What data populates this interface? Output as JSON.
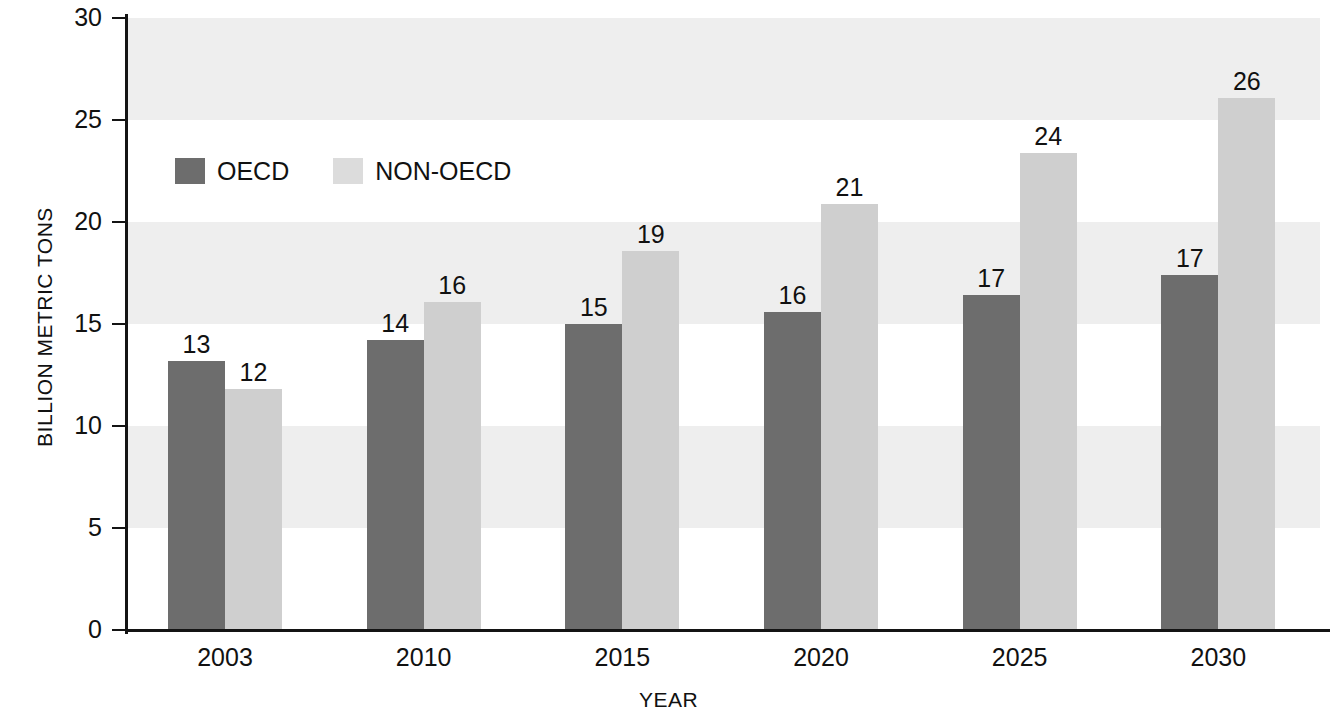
{
  "chart_data": {
    "type": "bar",
    "title": "",
    "xlabel": "YEAR",
    "ylabel": "BILLION METRIC TONS",
    "categories": [
      "2003",
      "2010",
      "2015",
      "2020",
      "2025",
      "2030"
    ],
    "series": [
      {
        "name": "OECD",
        "color": "#6d6d6d",
        "values": [
          13,
          14,
          15,
          16,
          17,
          17
        ],
        "plotted": [
          13.2,
          14.2,
          15.0,
          15.6,
          16.4,
          17.4
        ]
      },
      {
        "name": "NON-OECD",
        "color": "#cfcfcf",
        "values": [
          12,
          16,
          19,
          21,
          24,
          26
        ],
        "plotted": [
          11.8,
          16.1,
          18.6,
          20.9,
          23.4,
          26.1
        ]
      }
    ],
    "ylim": [
      0,
      30
    ],
    "yticks": [
      0,
      5,
      10,
      15,
      20,
      25,
      30
    ],
    "ytick_labels": [
      "0",
      "5",
      "10",
      "15",
      "20",
      "25",
      "30"
    ],
    "grid": false,
    "banding": "alternating horizontal bands every 5 units",
    "legend_position": "upper-left inside plot"
  },
  "axes": {
    "y_title": "BILLION METRIC TONS",
    "x_title": "YEAR"
  },
  "legend": {
    "items": [
      {
        "label": "OECD",
        "swatch": "dark-gray-swatch"
      },
      {
        "label": "NON-OECD",
        "swatch": "light-gray-swatch"
      }
    ]
  }
}
